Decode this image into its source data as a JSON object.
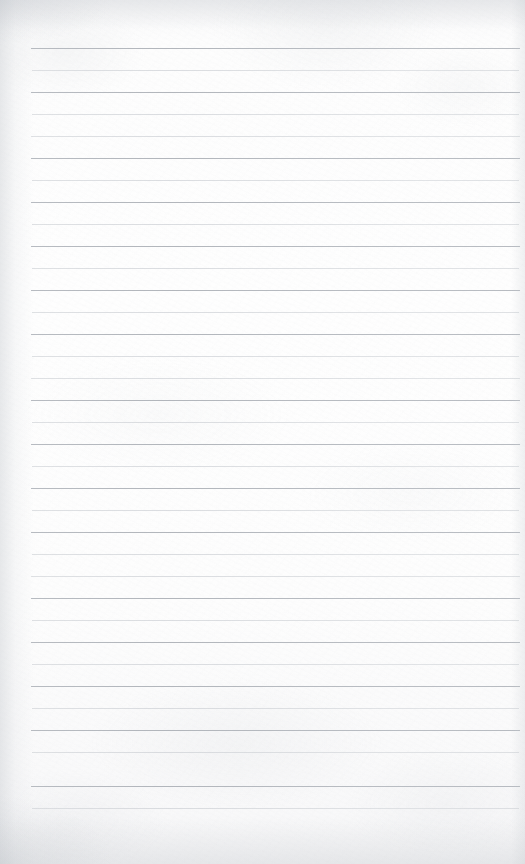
{
  "document": {
    "kind": "scanned-lined-paper",
    "title": "Blank lined notebook page",
    "page_width": 525,
    "page_height": 864,
    "text_content": "",
    "handwriting_present": "no",
    "printed_text_present": "no"
  },
  "paper": {
    "background_color": "#fdfdfd",
    "tint_color": "#f7f7f8",
    "edge_shadow_color": "#c4c8cd",
    "texture": "faint mottled scan grain"
  },
  "ruling": {
    "style": "horizontal ruled lines",
    "line_color_dark": "#b3b7bd",
    "line_color_light": "#d2d5d9",
    "line_count": 35,
    "first_line_y": 48,
    "line_spacing": 22,
    "line_left_x": 31,
    "line_right_x": 520,
    "margin_rule_present": "no",
    "lines": [
      {
        "y": 48,
        "x1": 31,
        "x2": 520,
        "weight": "dark"
      },
      {
        "y": 70,
        "x1": 32,
        "x2": 519,
        "weight": "light"
      },
      {
        "y": 92,
        "x1": 31,
        "x2": 520,
        "weight": "dark"
      },
      {
        "y": 114,
        "x1": 32,
        "x2": 519,
        "weight": "light"
      },
      {
        "y": 136,
        "x1": 31,
        "x2": 520,
        "weight": "light"
      },
      {
        "y": 158,
        "x1": 31,
        "x2": 520,
        "weight": "dark"
      },
      {
        "y": 180,
        "x1": 32,
        "x2": 519,
        "weight": "light"
      },
      {
        "y": 202,
        "x1": 31,
        "x2": 520,
        "weight": "dark"
      },
      {
        "y": 224,
        "x1": 32,
        "x2": 519,
        "weight": "light"
      },
      {
        "y": 246,
        "x1": 31,
        "x2": 520,
        "weight": "dark"
      },
      {
        "y": 268,
        "x1": 32,
        "x2": 519,
        "weight": "light"
      },
      {
        "y": 290,
        "x1": 31,
        "x2": 520,
        "weight": "dark"
      },
      {
        "y": 312,
        "x1": 32,
        "x2": 519,
        "weight": "light"
      },
      {
        "y": 334,
        "x1": 31,
        "x2": 520,
        "weight": "dark"
      },
      {
        "y": 356,
        "x1": 32,
        "x2": 519,
        "weight": "light"
      },
      {
        "y": 378,
        "x1": 31,
        "x2": 520,
        "weight": "light"
      },
      {
        "y": 400,
        "x1": 31,
        "x2": 520,
        "weight": "dark"
      },
      {
        "y": 422,
        "x1": 32,
        "x2": 519,
        "weight": "light"
      },
      {
        "y": 444,
        "x1": 31,
        "x2": 520,
        "weight": "dark"
      },
      {
        "y": 466,
        "x1": 32,
        "x2": 519,
        "weight": "light"
      },
      {
        "y": 488,
        "x1": 31,
        "x2": 520,
        "weight": "dark"
      },
      {
        "y": 510,
        "x1": 32,
        "x2": 519,
        "weight": "light"
      },
      {
        "y": 532,
        "x1": 31,
        "x2": 520,
        "weight": "dark"
      },
      {
        "y": 554,
        "x1": 32,
        "x2": 519,
        "weight": "light"
      },
      {
        "y": 576,
        "x1": 31,
        "x2": 520,
        "weight": "light"
      },
      {
        "y": 598,
        "x1": 31,
        "x2": 520,
        "weight": "dark"
      },
      {
        "y": 620,
        "x1": 32,
        "x2": 519,
        "weight": "light"
      },
      {
        "y": 642,
        "x1": 31,
        "x2": 520,
        "weight": "dark"
      },
      {
        "y": 664,
        "x1": 32,
        "x2": 519,
        "weight": "light"
      },
      {
        "y": 686,
        "x1": 31,
        "x2": 520,
        "weight": "dark"
      },
      {
        "y": 708,
        "x1": 32,
        "x2": 519,
        "weight": "light"
      },
      {
        "y": 730,
        "x1": 31,
        "x2": 520,
        "weight": "dark"
      },
      {
        "y": 752,
        "x1": 32,
        "x2": 519,
        "weight": "light"
      },
      {
        "y": 786,
        "x1": 31,
        "x2": 520,
        "weight": "dark"
      },
      {
        "y": 808,
        "x1": 32,
        "x2": 519,
        "weight": "light"
      }
    ]
  }
}
